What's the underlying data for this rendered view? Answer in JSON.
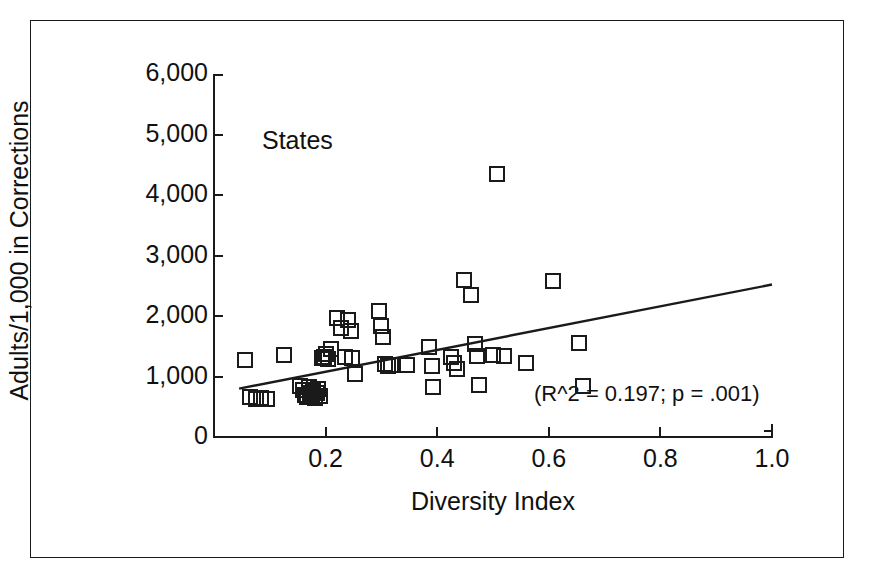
{
  "chart_data": {
    "type": "scatter",
    "title": "",
    "series_label": "States",
    "xlabel": "Diversity Index",
    "ylabel": "Adults/1,000 in Corrections",
    "xlim": [
      0.0,
      1.0
    ],
    "ylim": [
      0,
      6000
    ],
    "grid": false,
    "legend_position": "none",
    "x_ticks": [
      0.2,
      0.4,
      0.6,
      0.8,
      1.0
    ],
    "x_tick_labels": [
      "0.2",
      "0.4",
      "0.6",
      "0.8",
      "1.0"
    ],
    "y_ticks": [
      0,
      1000,
      2000,
      3000,
      4000,
      5000,
      6000
    ],
    "y_tick_labels": [
      "0",
      "1,000",
      "2,000",
      "3,000",
      "4,000",
      "5,000",
      "6,000"
    ],
    "annotation": "(R^2 = 0.197; p = .001)",
    "r_squared": 0.197,
    "p_value": 0.001,
    "marker_style": "open-square",
    "marker_color": "#1a1a1a",
    "line_color": "#1a1a1a",
    "trendline": {
      "x": [
        0.045,
        1.0
      ],
      "y": [
        800,
        2520
      ]
    },
    "points": [
      {
        "x": 0.055,
        "y": 1280
      },
      {
        "x": 0.065,
        "y": 660
      },
      {
        "x": 0.075,
        "y": 620
      },
      {
        "x": 0.085,
        "y": 640
      },
      {
        "x": 0.095,
        "y": 620
      },
      {
        "x": 0.125,
        "y": 1350
      },
      {
        "x": 0.155,
        "y": 840
      },
      {
        "x": 0.16,
        "y": 770
      },
      {
        "x": 0.163,
        "y": 700
      },
      {
        "x": 0.166,
        "y": 660
      },
      {
        "x": 0.17,
        "y": 820
      },
      {
        "x": 0.172,
        "y": 730
      },
      {
        "x": 0.175,
        "y": 690
      },
      {
        "x": 0.178,
        "y": 760
      },
      {
        "x": 0.181,
        "y": 640
      },
      {
        "x": 0.184,
        "y": 720
      },
      {
        "x": 0.187,
        "y": 800
      },
      {
        "x": 0.19,
        "y": 670
      },
      {
        "x": 0.193,
        "y": 1300
      },
      {
        "x": 0.197,
        "y": 1330
      },
      {
        "x": 0.2,
        "y": 1370
      },
      {
        "x": 0.205,
        "y": 1290
      },
      {
        "x": 0.21,
        "y": 1450
      },
      {
        "x": 0.22,
        "y": 1960
      },
      {
        "x": 0.228,
        "y": 1800
      },
      {
        "x": 0.234,
        "y": 1330
      },
      {
        "x": 0.24,
        "y": 1940
      },
      {
        "x": 0.245,
        "y": 1760
      },
      {
        "x": 0.248,
        "y": 1310
      },
      {
        "x": 0.252,
        "y": 1040
      },
      {
        "x": 0.295,
        "y": 2080
      },
      {
        "x": 0.3,
        "y": 1840
      },
      {
        "x": 0.303,
        "y": 1650
      },
      {
        "x": 0.307,
        "y": 1210
      },
      {
        "x": 0.312,
        "y": 1170
      },
      {
        "x": 0.318,
        "y": 1190
      },
      {
        "x": 0.345,
        "y": 1190
      },
      {
        "x": 0.385,
        "y": 1490
      },
      {
        "x": 0.39,
        "y": 1170
      },
      {
        "x": 0.392,
        "y": 830
      },
      {
        "x": 0.425,
        "y": 1330
      },
      {
        "x": 0.43,
        "y": 1230
      },
      {
        "x": 0.435,
        "y": 1130
      },
      {
        "x": 0.448,
        "y": 2600
      },
      {
        "x": 0.46,
        "y": 2340
      },
      {
        "x": 0.468,
        "y": 1530
      },
      {
        "x": 0.472,
        "y": 1340
      },
      {
        "x": 0.475,
        "y": 860
      },
      {
        "x": 0.5,
        "y": 1350
      },
      {
        "x": 0.508,
        "y": 4350
      },
      {
        "x": 0.52,
        "y": 1340
      },
      {
        "x": 0.56,
        "y": 1220
      },
      {
        "x": 0.608,
        "y": 2580
      },
      {
        "x": 0.655,
        "y": 1560
      },
      {
        "x": 0.662,
        "y": 850
      }
    ]
  }
}
